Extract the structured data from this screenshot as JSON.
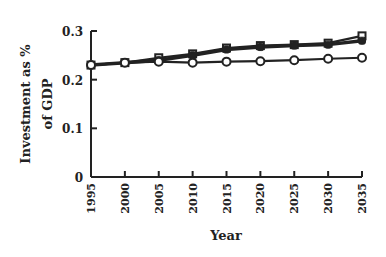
{
  "chart_data": {
    "type": "line",
    "title": "",
    "xlabel": "Year",
    "ylabel": "Investment as % of GDP",
    "ylabel_lines": [
      "Investment as %",
      "of GDP"
    ],
    "x": [
      1995,
      2000,
      2005,
      2010,
      2015,
      2020,
      2025,
      2030,
      2035
    ],
    "x_tick_labels": [
      "1995",
      "2000",
      "2005",
      "2010",
      "2015",
      "2020",
      "2025",
      "2030",
      "2035"
    ],
    "y_tick_labels": [
      "0",
      "0.1",
      "0.2",
      "0.3"
    ],
    "y_ticks": [
      0,
      0.1,
      0.2,
      0.3
    ],
    "ylim": [
      0,
      0.3
    ],
    "xlim": [
      1995,
      2035
    ],
    "grid": false,
    "legend": null,
    "series": [
      {
        "name": "open-square",
        "marker": "open-square",
        "values": [
          0.23,
          0.235,
          0.245,
          0.253,
          0.265,
          0.27,
          0.272,
          0.275,
          0.29
        ]
      },
      {
        "name": "filled-marker",
        "marker": "filled",
        "values": [
          0.23,
          0.235,
          0.24,
          0.25,
          0.262,
          0.267,
          0.27,
          0.272,
          0.28
        ]
      },
      {
        "name": "open-circle",
        "marker": "open-circle",
        "values": [
          0.23,
          0.235,
          0.237,
          0.235,
          0.237,
          0.238,
          0.24,
          0.243,
          0.245
        ]
      }
    ]
  },
  "colors": {
    "line": "#222222",
    "background": "#ffffff"
  }
}
